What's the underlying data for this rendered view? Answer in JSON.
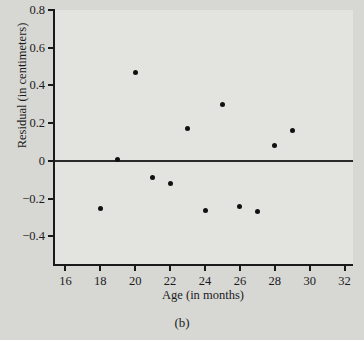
{
  "caption": "(b)",
  "chart_data": {
    "type": "scatter",
    "title": "",
    "xlabel": "Age (in months)",
    "ylabel": "Residual (in centimeters)",
    "xlim": [
      15.4,
      32.6
    ],
    "ylim": [
      -0.557,
      0.8
    ],
    "xticks": [
      16,
      18,
      20,
      22,
      24,
      26,
      28,
      30,
      32
    ],
    "xtick_labels": [
      "16",
      "18",
      "20",
      "22",
      "24",
      "26",
      "28",
      "30",
      "32"
    ],
    "yticks": [
      0.8,
      0.6,
      0.4,
      0.2,
      0,
      -0.2,
      -0.4
    ],
    "ytick_labels": [
      "0.8",
      "0.6",
      "0.4",
      "0.2",
      "0",
      "−0.2",
      "−0.4"
    ],
    "grid": false,
    "legend": null,
    "reference_line": {
      "orientation": "horizontal",
      "y": 0,
      "color": "#2a2a2a"
    },
    "x": [
      18,
      19,
      20,
      21,
      22,
      23,
      24,
      25,
      26,
      27,
      28,
      29
    ],
    "y": [
      -0.25,
      0.01,
      0.47,
      -0.09,
      -0.12,
      0.17,
      -0.265,
      0.3,
      -0.24,
      -0.27,
      0.08,
      0.16
    ],
    "marker": {
      "shape": "circle",
      "color": "#111111",
      "size": 5
    },
    "background_color": "#e3e3e0",
    "axis_color": "#1a1a1a"
  }
}
